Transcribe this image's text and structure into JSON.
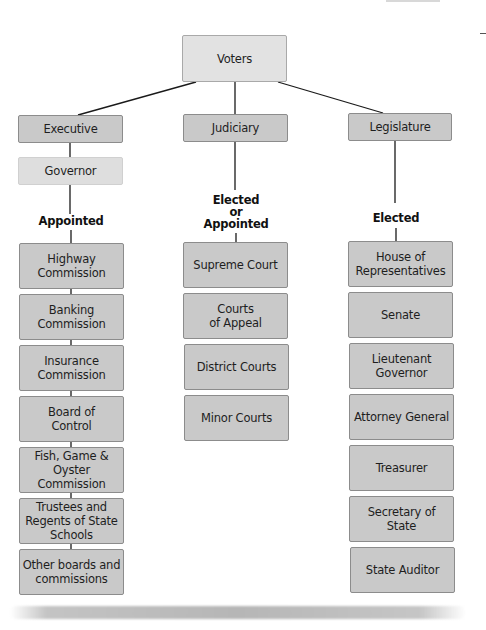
{
  "diagram": {
    "root": {
      "label": "Voters"
    },
    "branches": [
      {
        "label": "Executive",
        "head": "Governor",
        "selection": "Appointed",
        "offices": [
          "Highway\nCommission",
          "Banking\nCommission",
          "Insurance\nCommission",
          "Board of\nControl",
          "Fish, Game &\nOyster Commission",
          "Trustees and\nRegents of State\nSchools",
          "Other boards and\ncommissions"
        ]
      },
      {
        "label": "Judiciary",
        "selection": "Elected\nor\nAppointed",
        "offices": [
          "Supreme Court",
          "Courts\nof Appeal",
          "District Courts",
          "Minor Courts"
        ]
      },
      {
        "label": "Legislature",
        "selection": "Elected",
        "offices": [
          "House of\nRepresentatives",
          "Senate",
          "Lieutenant\nGovernor",
          "Attorney General",
          "Treasurer",
          "Secretary of\nState",
          "State Auditor"
        ]
      }
    ]
  },
  "colors": {
    "box_fill": "#c9c9c9",
    "box_fill_light": "#e2e2e2",
    "box_border": "#8c8c8c",
    "line": "#1a1a1a"
  }
}
